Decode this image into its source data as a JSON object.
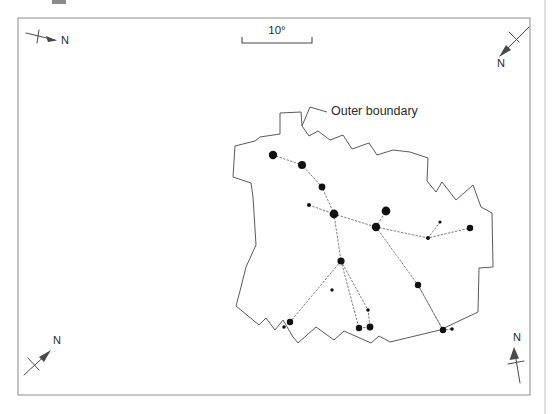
{
  "figure": {
    "kind": "star-chart",
    "background_color": "#ffffff",
    "frame": {
      "x": 18,
      "y": 18,
      "width": 512,
      "height": 377,
      "stroke_color": "#8d8d8d"
    },
    "page_rule": {
      "x": 545,
      "y_top": 0,
      "y_bottom": 414,
      "color": "#c9c9c9"
    },
    "crop_mark": {
      "x": 52,
      "y": 0,
      "width": 14,
      "height": 4,
      "color": "#8a8a8a"
    }
  },
  "scale_bar": {
    "label": "10°",
    "label_x": 277,
    "label_y": 34,
    "bar_left_x": 242,
    "bar_right_x": 312,
    "bar_y": 43,
    "tick_height": 6,
    "color": "#4a4a4a"
  },
  "annotations": [
    {
      "name": "outer-boundary-label",
      "text": "Outer boundary",
      "x": 331,
      "y": 115,
      "anchor": "start",
      "leader": "M 327 112 L 310 107 L 302 126"
    }
  ],
  "compass_roses": [
    {
      "name": "compass-top-left",
      "label": "N",
      "label_x": 61,
      "label_y": 44,
      "shaft": "M 26 33 L 55 40",
      "cross": "M 39 30 L 37 43",
      "head": "55,40 46,36 47,42",
      "color": "#4a4a4a"
    },
    {
      "name": "compass-top-right",
      "label": "N",
      "label_x": 497,
      "label_y": 67,
      "shaft": "M 529 27 L 500 56",
      "cross": "M 509 32 L 519 42",
      "head": "500,56 506,45 511,50",
      "color": "#4a4a4a"
    },
    {
      "name": "compass-bottom-left",
      "label": "N",
      "label_x": 53,
      "label_y": 344,
      "shaft": "M 24 375 L 50 351",
      "cross": "M 28 358 L 39 370",
      "head": "50,351 44,362 39,357",
      "color": "#4a4a4a"
    },
    {
      "name": "compass-bottom-right",
      "label": "N",
      "label_x": 513,
      "label_y": 341,
      "shaft": "M 520 383 L 514 348",
      "cross": "M 508 364 L 524 361",
      "head": "514,348 510,360 519,359",
      "color": "#4a4a4a"
    }
  ],
  "outer_boundary": {
    "name": "outer-boundary-polygon",
    "stroke_color": "#5a5a5a",
    "path": "M 302 126 L 301 112 L 280 113 L 280 134 L 260 137 L 255 141 L 235 146 L 233 177 L 251 183 L 253 197 L 256 245 L 246 267 L 241 287 L 236 306 L 259 325 L 266 318 L 275 330 L 283 320 L 293 337 L 298 343 L 316 327 L 334 340 L 344 331 L 371 343 L 379 336 L 390 342 L 440 330 L 478 312 L 479 268 L 493 267 L 492 213 L 481 207 L 473 185 L 456 200 L 442 182 L 436 192 L 427 181 L 428 158 L 410 152 L 393 150 L 377 155 L 369 143 L 352 149 L 343 135 L 330 140 L 318 131 L 309 136 Z"
  },
  "star_links": [
    {
      "name": "link-upper-chain",
      "path": "M 273 155 L 302 165 L 322 187 L 334 214 L 309 205"
    },
    {
      "name": "link-hub-west",
      "path": "M 334 214 L 376 227"
    },
    {
      "name": "link-hub-north",
      "path": "M 376 227 L 386 211"
    },
    {
      "name": "link-hub-east",
      "path": "M 376 227 L 428 238 L 470 228"
    },
    {
      "name": "link-east-spur",
      "path": "M 428 238 L 440 222"
    },
    {
      "name": "link-south-a",
      "path": "M 334 214 L 341 261 L 290 322"
    },
    {
      "name": "link-south-b",
      "path": "M 341 261 L 359 328 L 370 327"
    },
    {
      "name": "link-south-c",
      "path": "M 341 261 L 368 310 L 370 327"
    },
    {
      "name": "link-southeast",
      "path": "M 376 227 L 418 285 L 443 330 L 452 329"
    },
    {
      "name": "link-southeast-inner",
      "path": "M 418 285 L 443 330"
    }
  ],
  "stars": [
    {
      "name": "star-01",
      "x": 273,
      "y": 155,
      "r": 4.2
    },
    {
      "name": "star-02",
      "x": 302,
      "y": 165,
      "r": 4.0
    },
    {
      "name": "star-03",
      "x": 322,
      "y": 187,
      "r": 3.4
    },
    {
      "name": "star-04",
      "x": 309,
      "y": 205,
      "r": 2.0
    },
    {
      "name": "star-05",
      "x": 334,
      "y": 214,
      "r": 4.4
    },
    {
      "name": "star-06",
      "x": 386,
      "y": 211,
      "r": 4.4
    },
    {
      "name": "star-07",
      "x": 376,
      "y": 227,
      "r": 4.2
    },
    {
      "name": "star-08",
      "x": 440,
      "y": 222,
      "r": 1.6
    },
    {
      "name": "star-09",
      "x": 428,
      "y": 238,
      "r": 2.0
    },
    {
      "name": "star-10",
      "x": 470,
      "y": 228,
      "r": 3.2
    },
    {
      "name": "star-11",
      "x": 341,
      "y": 261,
      "r": 3.6
    },
    {
      "name": "star-12",
      "x": 418,
      "y": 285,
      "r": 3.2
    },
    {
      "name": "star-13",
      "x": 290,
      "y": 322,
      "r": 3.2
    },
    {
      "name": "star-14",
      "x": 284,
      "y": 327,
      "r": 1.8
    },
    {
      "name": "star-15",
      "x": 359,
      "y": 328,
      "r": 3.2
    },
    {
      "name": "star-16",
      "x": 368,
      "y": 310,
      "r": 1.8
    },
    {
      "name": "star-17",
      "x": 370,
      "y": 327,
      "r": 3.4
    },
    {
      "name": "star-18",
      "x": 443,
      "y": 330,
      "r": 3.2
    },
    {
      "name": "star-19",
      "x": 452,
      "y": 329,
      "r": 1.8
    },
    {
      "name": "star-20",
      "x": 332,
      "y": 290,
      "r": 1.7
    }
  ]
}
